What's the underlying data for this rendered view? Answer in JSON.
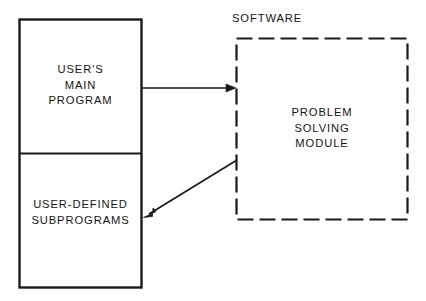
{
  "diagram": {
    "background_color": "#ffffff",
    "stroke_color": "#1a1a1a",
    "user_block": {
      "name": "user-program-block",
      "upper_section_label": "USER'S\nMAIN\nPROGRAM",
      "lower_section_label": "USER-DEFINED\nSUBPROGRAMS",
      "border_style": "solid",
      "x": 19,
      "y": 19,
      "width": 123,
      "height": 269,
      "divider_y": 153
    },
    "software_block": {
      "name": "software-module-block",
      "group_label": "SOFTWARE",
      "inner_label": "PROBLEM\nSOLVING\nMODULE",
      "border_style": "dashed",
      "x": 236,
      "y": 38,
      "width": 172,
      "height": 182,
      "dash_pattern": "16 6"
    },
    "connectors": [
      {
        "name": "call-arrow-to-module",
        "direction": "right",
        "from": "USER'S MAIN PROGRAM",
        "to": "PROBLEM SOLVING MODULE",
        "x1": 142,
        "y1": 88,
        "x2": 237,
        "y2": 88
      },
      {
        "name": "return-arrow-to-subprograms",
        "direction": "down-left",
        "from": "PROBLEM SOLVING MODULE",
        "to": "USER-DEFINED SUBPROGRAMS",
        "x1": 237,
        "y1": 160,
        "x2": 144,
        "y2": 217
      }
    ]
  }
}
